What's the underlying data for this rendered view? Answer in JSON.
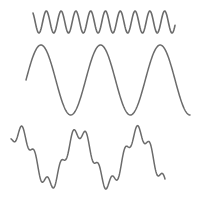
{
  "diagram": {
    "stroke_color": "#6b6b6b",
    "background": "#ffffff",
    "waves": [
      {
        "name": "high-frequency-sine",
        "x_start": 33,
        "x_end": 175,
        "center_y": 22,
        "amplitude": 11,
        "cycles": 9.6,
        "phase": 0.35,
        "stroke_width": 1.6
      },
      {
        "name": "low-frequency-sine",
        "x_start": 26,
        "x_end": 190,
        "center_y": 80,
        "amplitude": 35,
        "cycles": 2.75,
        "phase": 0.0,
        "stroke_width": 1.5
      },
      {
        "name": "sum-wave",
        "x_start": 11,
        "x_end": 165,
        "center_y": 158,
        "low_amplitude": 26,
        "low_cycles": 2.6,
        "low_phase": 0.1,
        "high_amplitude": 6.5,
        "high_cycles": 12,
        "high_phase": 0.4,
        "stroke_width": 1.5
      }
    ]
  }
}
